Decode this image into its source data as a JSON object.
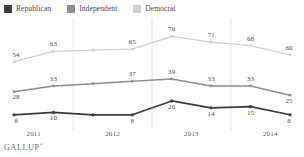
{
  "brand": {
    "name": "GALLUP",
    "mark": "®"
  },
  "legend": {
    "position": "top-left",
    "items": [
      {
        "label": "Republican",
        "color": "#3c3c3c"
      },
      {
        "label": "Independent",
        "color": "#8d8d8d"
      },
      {
        "label": "Democrat",
        "color": "#cfcfcf"
      }
    ]
  },
  "chart_data": {
    "type": "line",
    "title": "",
    "subtitle": "",
    "xlabel": "",
    "ylabel": "",
    "grid": true,
    "gridlines": "vertical-year-boundaries",
    "legend_position": "top-left",
    "ylim": [
      0,
      85
    ],
    "xlim": [
      0,
      7
    ],
    "x": [
      0,
      1,
      2,
      3,
      4,
      5,
      6,
      7
    ],
    "categories": [
      "2011",
      "2011",
      "2012",
      "2012",
      "2013",
      "2013",
      "2014",
      "2014"
    ],
    "tick_labels": [
      "2011",
      "2012",
      "2013",
      "2014"
    ],
    "series": [
      {
        "name": "Republican",
        "color": "#3c3c3c",
        "values": [
          8,
          10,
          8,
          8,
          20,
          14,
          15,
          8
        ],
        "labels": [
          "8",
          "10",
          "",
          "8",
          "20",
          "14",
          "15",
          "8"
        ]
      },
      {
        "name": "Independent",
        "color": "#8d8d8d",
        "values": [
          28,
          33,
          35,
          37,
          39,
          33,
          33,
          25
        ],
        "labels": [
          "28",
          "33",
          "",
          "37",
          "39",
          "33",
          "33",
          "25"
        ]
      },
      {
        "name": "Democrat",
        "color": "#cfcfcf",
        "values": [
          54,
          63,
          64,
          65,
          76,
          71,
          68,
          60
        ],
        "labels": [
          "54",
          "63",
          "",
          "65",
          "76",
          "71",
          "68",
          "60"
        ]
      }
    ]
  }
}
